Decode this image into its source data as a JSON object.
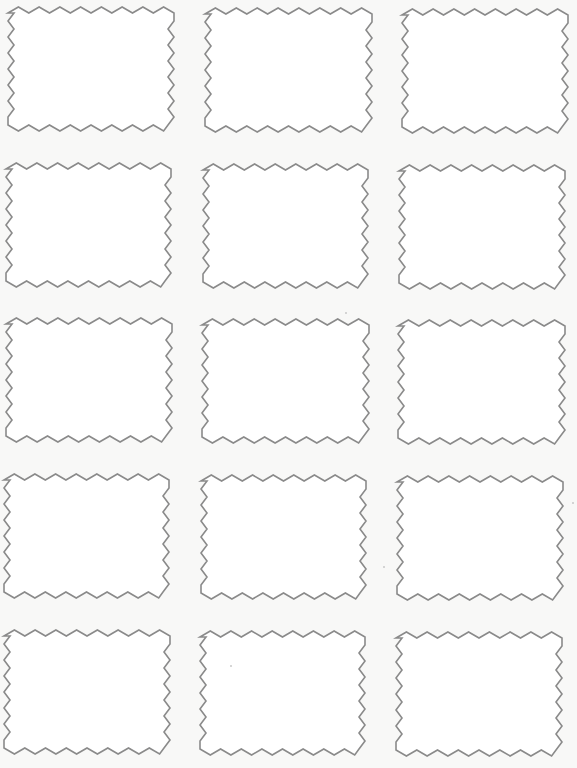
{
  "page": {
    "title": "",
    "background_color": "#f8f8f7",
    "width": 577,
    "height": 768
  },
  "label_style": {
    "stroke_color": "#8a8a8a",
    "fill_color": "#ffffff",
    "stroke_width": 1.6,
    "teeth_horizontal": 8,
    "teeth_vertical": 7,
    "tooth_depth": 6,
    "shape": "zigzag-edged rectangle"
  },
  "grid": {
    "rows": 5,
    "columns": 3
  },
  "labels": [
    {
      "row": 1,
      "col": 1,
      "x": 8,
      "y": 7,
      "w": 166,
      "h": 124,
      "text": ""
    },
    {
      "row": 1,
      "col": 2,
      "x": 205,
      "y": 8,
      "w": 167,
      "h": 124,
      "text": ""
    },
    {
      "row": 1,
      "col": 3,
      "x": 402,
      "y": 9,
      "w": 166,
      "h": 124,
      "text": ""
    },
    {
      "row": 2,
      "col": 1,
      "x": 6,
      "y": 163,
      "w": 165,
      "h": 124,
      "text": ""
    },
    {
      "row": 2,
      "col": 2,
      "x": 203,
      "y": 164,
      "w": 165,
      "h": 124,
      "text": ""
    },
    {
      "row": 2,
      "col": 3,
      "x": 399,
      "y": 165,
      "w": 166,
      "h": 124,
      "text": ""
    },
    {
      "row": 3,
      "col": 1,
      "x": 6,
      "y": 318,
      "w": 166,
      "h": 124,
      "text": ""
    },
    {
      "row": 3,
      "col": 2,
      "x": 202,
      "y": 319,
      "w": 167,
      "h": 124,
      "text": ""
    },
    {
      "row": 3,
      "col": 3,
      "x": 398,
      "y": 320,
      "w": 167,
      "h": 124,
      "text": ""
    },
    {
      "row": 4,
      "col": 1,
      "x": 4,
      "y": 474,
      "w": 165,
      "h": 124,
      "text": ""
    },
    {
      "row": 4,
      "col": 2,
      "x": 201,
      "y": 475,
      "w": 165,
      "h": 124,
      "text": ""
    },
    {
      "row": 4,
      "col": 3,
      "x": 397,
      "y": 476,
      "w": 166,
      "h": 124,
      "text": ""
    },
    {
      "row": 5,
      "col": 1,
      "x": 4,
      "y": 630,
      "w": 166,
      "h": 124,
      "text": ""
    },
    {
      "row": 5,
      "col": 2,
      "x": 200,
      "y": 631,
      "w": 165,
      "h": 124,
      "text": ""
    },
    {
      "row": 5,
      "col": 3,
      "x": 396,
      "y": 632,
      "w": 166,
      "h": 124,
      "text": ""
    }
  ]
}
